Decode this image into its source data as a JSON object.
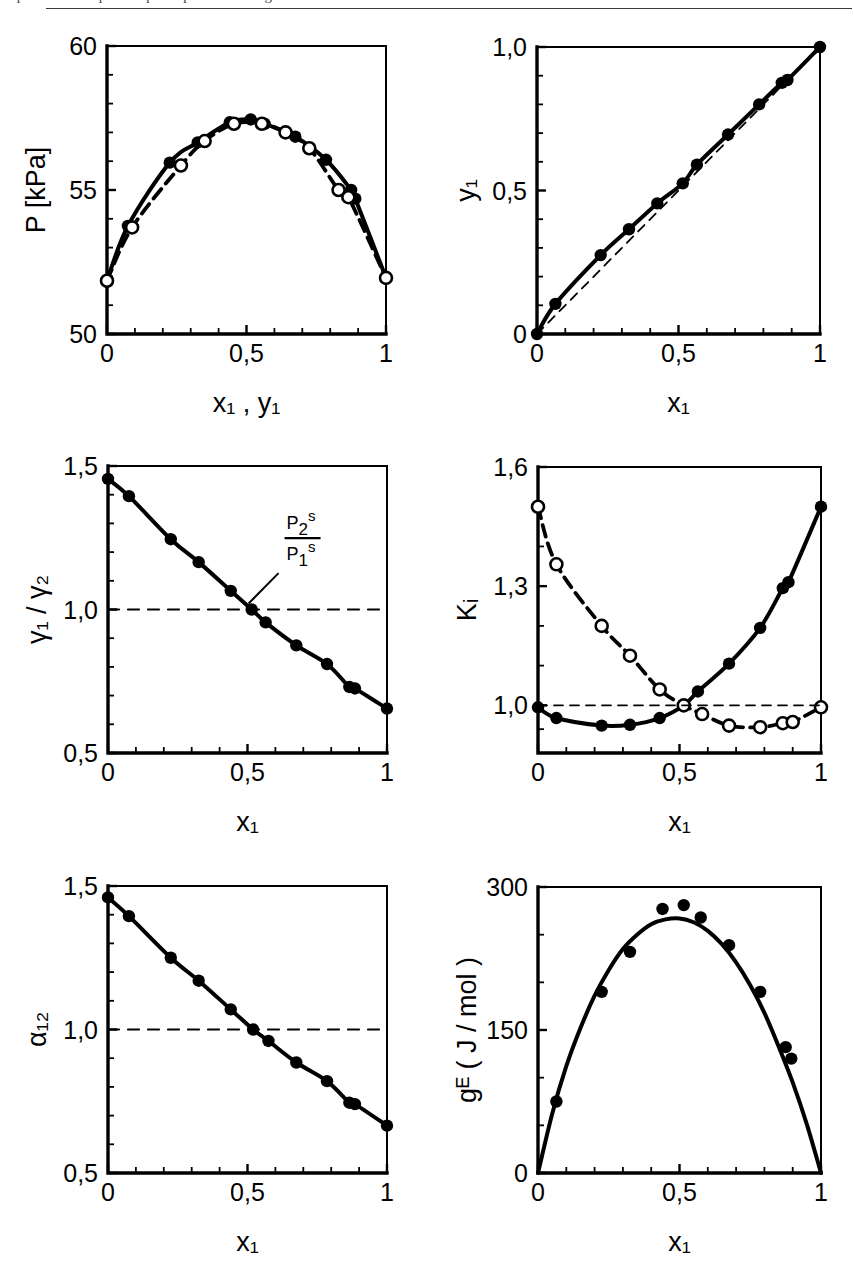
{
  "figure": {
    "header_sliver": "Experimental vapour–liquid equilibrium diagrams",
    "panel_count": 6
  },
  "chart_data": [
    {
      "id": "p-xy",
      "type": "line",
      "title": "",
      "xlabel": "x₁ , y₁",
      "ylabel": "P [kPa]",
      "xlim": [
        0,
        1
      ],
      "ylim": [
        50,
        60
      ],
      "xticks": [
        0,
        0.5,
        1
      ],
      "xticklabels": [
        "0",
        "0,5",
        "1"
      ],
      "xminorticks": [
        0.1,
        0.2,
        0.3,
        0.4,
        0.6,
        0.7,
        0.8,
        0.9
      ],
      "yticks": [
        50,
        55,
        60
      ],
      "yticklabels": [
        "50",
        "55",
        "60"
      ],
      "yminorticks": [
        51,
        52,
        53,
        54,
        56,
        57,
        58,
        59
      ],
      "grid": false,
      "legend": "none",
      "series": [
        {
          "name": "bubble point (x₁, P)",
          "marker": "filled-circle",
          "line": "solid",
          "x": [
            0.0,
            0.075,
            0.225,
            0.325,
            0.44,
            0.515,
            0.565,
            0.675,
            0.785,
            0.875,
            0.89,
            1.0
          ],
          "y": [
            51.85,
            53.75,
            55.95,
            56.65,
            57.35,
            57.45,
            57.3,
            56.85,
            56.05,
            55.0,
            54.7,
            51.95
          ]
        },
        {
          "name": "dew point (y₁, P)",
          "marker": "open-circle",
          "line": "dashed",
          "x": [
            0.0,
            0.09,
            0.265,
            0.35,
            0.455,
            0.555,
            0.64,
            0.725,
            0.83,
            0.865,
            1.0
          ],
          "y": [
            51.85,
            53.7,
            55.85,
            56.7,
            57.3,
            57.3,
            57.0,
            56.45,
            55.0,
            54.75,
            51.95
          ]
        }
      ]
    },
    {
      "id": "x-y",
      "type": "line",
      "title": "",
      "xlabel": "x₁",
      "ylabel": "y₁",
      "xlim": [
        0,
        1
      ],
      "ylim": [
        0,
        1
      ],
      "xticks": [
        0,
        0.5,
        1
      ],
      "xticklabels": [
        "0",
        "0,5",
        "1"
      ],
      "xminorticks": [
        0.1,
        0.2,
        0.3,
        0.4,
        0.6,
        0.7,
        0.8,
        0.9
      ],
      "yticks": [
        0,
        0.5,
        1.0
      ],
      "yticklabels": [
        "0",
        "0,5",
        "1,0"
      ],
      "yminorticks": [
        0.1,
        0.2,
        0.3,
        0.4,
        0.6,
        0.7,
        0.8,
        0.9
      ],
      "grid": false,
      "legend": "none",
      "series": [
        {
          "name": "equilibrium curve",
          "marker": "filled-circle",
          "line": "solid",
          "x": [
            0.0,
            0.065,
            0.225,
            0.325,
            0.425,
            0.515,
            0.565,
            0.675,
            0.785,
            0.865,
            0.885,
            1.0
          ],
          "y": [
            0.0,
            0.105,
            0.275,
            0.365,
            0.455,
            0.525,
            0.59,
            0.695,
            0.8,
            0.875,
            0.885,
            1.0
          ]
        },
        {
          "name": "diagonal y₁ = x₁",
          "marker": "none",
          "line": "thin-dashed",
          "x": [
            0.0,
            1.0
          ],
          "y": [
            0.0,
            1.0
          ]
        }
      ]
    },
    {
      "id": "gamma-ratio",
      "type": "line",
      "title": "",
      "xlabel": "x₁",
      "ylabel": "γ₁ / γ₂",
      "xlim": [
        0,
        1
      ],
      "ylim": [
        0.5,
        1.5
      ],
      "xticks": [
        0,
        0.5,
        1
      ],
      "xticklabels": [
        "0",
        "0,5",
        "1"
      ],
      "xminorticks": [
        0.1,
        0.2,
        0.3,
        0.4,
        0.6,
        0.7,
        0.8,
        0.9
      ],
      "yticks": [
        0.5,
        1.0,
        1.5
      ],
      "yticklabels": [
        "0,5",
        "1,0",
        "1,5"
      ],
      "yminorticks": [
        0.6,
        0.7,
        0.8,
        0.9,
        1.1,
        1.2,
        1.3,
        1.4
      ],
      "grid": false,
      "legend": "none",
      "annotation": {
        "text_numerator": "P",
        "text_numerator_sub": "2",
        "text_numerator_sup": "s",
        "text_denominator": "P",
        "text_denominator_sub": "1",
        "text_denominator_sup": "s",
        "points_to_y": 1.0
      },
      "series": [
        {
          "name": "γ₁/γ₂",
          "marker": "filled-circle",
          "line": "solid",
          "x": [
            0.0,
            0.075,
            0.225,
            0.325,
            0.44,
            0.515,
            0.565,
            0.675,
            0.785,
            0.865,
            0.885,
            1.0
          ],
          "y": [
            1.455,
            1.395,
            1.245,
            1.165,
            1.065,
            1.0,
            0.955,
            0.875,
            0.81,
            0.73,
            0.725,
            0.655
          ]
        },
        {
          "name": "reference line γ₁/γ₂ = 1",
          "marker": "none",
          "line": "dashed",
          "x": [
            0.0,
            1.0
          ],
          "y": [
            1.0,
            1.0
          ]
        }
      ]
    },
    {
      "id": "k-values",
      "type": "line",
      "title": "",
      "xlabel": "x₁",
      "ylabel": "Kᵢ",
      "xlim": [
        0,
        1
      ],
      "ylim": [
        0.88,
        1.6
      ],
      "xticks": [
        0,
        0.5,
        1
      ],
      "xticklabels": [
        "0",
        "0,5",
        "1"
      ],
      "xminorticks": [
        0.1,
        0.2,
        0.3,
        0.4,
        0.6,
        0.7,
        0.8,
        0.9
      ],
      "yticks": [
        1.0,
        1.3,
        1.6
      ],
      "yticklabels": [
        "1,0",
        "1,3",
        "1,6"
      ],
      "yminorticks": [
        0.94,
        1.1,
        1.2,
        1.4,
        1.5
      ],
      "grid": false,
      "legend": "none",
      "series": [
        {
          "name": "K₁",
          "marker": "filled-circle",
          "line": "solid",
          "x": [
            0.0,
            0.065,
            0.225,
            0.325,
            0.43,
            0.515,
            0.565,
            0.675,
            0.785,
            0.865,
            0.885,
            1.0
          ],
          "y": [
            0.995,
            0.968,
            0.949,
            0.951,
            0.968,
            1.0,
            1.035,
            1.105,
            1.195,
            1.295,
            1.31,
            1.5
          ]
        },
        {
          "name": "K₂",
          "marker": "open-circle",
          "line": "dashed",
          "x": [
            0.0,
            0.065,
            0.225,
            0.325,
            0.43,
            0.515,
            0.58,
            0.675,
            0.785,
            0.865,
            0.9,
            1.0
          ],
          "y": [
            1.5,
            1.355,
            1.2,
            1.125,
            1.04,
            1.0,
            0.978,
            0.949,
            0.945,
            0.955,
            0.958,
            0.995
          ]
        },
        {
          "name": "reference line K = 1",
          "marker": "none",
          "line": "thin-dashed",
          "x": [
            0.0,
            1.0
          ],
          "y": [
            1.0,
            1.0
          ]
        }
      ]
    },
    {
      "id": "alpha12",
      "type": "line",
      "title": "",
      "xlabel": "x₁",
      "ylabel": "α₁₂",
      "xlim": [
        0,
        1
      ],
      "ylim": [
        0.5,
        1.5
      ],
      "xticks": [
        0,
        0.5,
        1
      ],
      "xticklabels": [
        "0",
        "0,5",
        "1"
      ],
      "xminorticks": [
        0.1,
        0.2,
        0.3,
        0.4,
        0.6,
        0.7,
        0.8,
        0.9
      ],
      "yticks": [
        0.5,
        1.0,
        1.5
      ],
      "yticklabels": [
        "0,5",
        "1,0",
        "1,5"
      ],
      "yminorticks": [
        0.6,
        0.7,
        0.8,
        0.9,
        1.1,
        1.2,
        1.3,
        1.4
      ],
      "grid": false,
      "legend": "none",
      "series": [
        {
          "name": "α₁₂",
          "marker": "filled-circle",
          "line": "solid",
          "x": [
            0.0,
            0.075,
            0.225,
            0.325,
            0.44,
            0.52,
            0.575,
            0.675,
            0.785,
            0.865,
            0.885,
            1.0
          ],
          "y": [
            1.46,
            1.395,
            1.25,
            1.17,
            1.07,
            1.0,
            0.96,
            0.885,
            0.82,
            0.745,
            0.74,
            0.665
          ]
        },
        {
          "name": "reference line α₁₂ = 1",
          "marker": "none",
          "line": "dashed",
          "x": [
            0.0,
            1.0
          ],
          "y": [
            1.0,
            1.0
          ]
        }
      ]
    },
    {
      "id": "excess-gibbs",
      "type": "line",
      "title": "",
      "xlabel": "x₁",
      "ylabel": "gᴱ ( J / mol )",
      "xlim": [
        0,
        1
      ],
      "ylim": [
        0,
        300
      ],
      "xticks": [
        0,
        0.5,
        1
      ],
      "xticklabels": [
        "0",
        "0,5",
        "1"
      ],
      "xminorticks": [
        0.1,
        0.2,
        0.3,
        0.4,
        0.6,
        0.7,
        0.8,
        0.9
      ],
      "yticks": [
        0,
        150,
        300
      ],
      "yticklabels": [
        "0",
        "150",
        "300"
      ],
      "yminorticks": [
        50,
        100,
        200,
        250
      ],
      "grid": false,
      "legend": "none",
      "series": [
        {
          "name": "gᴱ data",
          "marker": "filled-circle",
          "line": "none",
          "x": [
            0.065,
            0.225,
            0.325,
            0.44,
            0.515,
            0.575,
            0.675,
            0.785,
            0.875,
            0.895
          ],
          "y": [
            75,
            190,
            232,
            277,
            281,
            268,
            239,
            190,
            132,
            120
          ]
        },
        {
          "name": "gᴱ correlation",
          "marker": "none",
          "line": "solid",
          "x": [
            0.0,
            0.05,
            0.1,
            0.15,
            0.2,
            0.25,
            0.3,
            0.35,
            0.4,
            0.45,
            0.5,
            0.55,
            0.6,
            0.65,
            0.7,
            0.75,
            0.8,
            0.85,
            0.9,
            0.95,
            1.0
          ],
          "y": [
            0,
            62,
            112,
            152,
            186,
            213,
            235,
            250,
            261,
            266,
            267,
            263,
            254,
            240,
            221,
            197,
            168,
            133,
            95,
            51,
            0
          ]
        }
      ]
    }
  ]
}
